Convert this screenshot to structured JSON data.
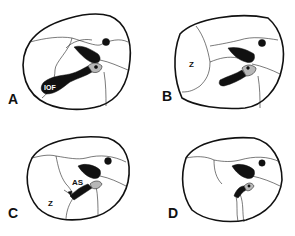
{
  "figure": {
    "panels": [
      {
        "id": "A",
        "label": "A",
        "annotations": [
          "IOF"
        ]
      },
      {
        "id": "B",
        "label": "B",
        "annotations": [
          "Z"
        ]
      },
      {
        "id": "C",
        "label": "C",
        "annotations": [
          "AS",
          "Z"
        ]
      },
      {
        "id": "D",
        "label": "D",
        "annotations": []
      }
    ]
  },
  "colors": {
    "ink": "#111111",
    "shade": "#b8b8b8",
    "background": "#ffffff"
  }
}
